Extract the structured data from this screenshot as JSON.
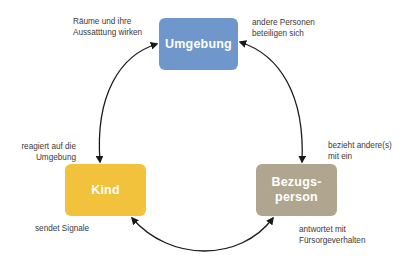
{
  "nodes": {
    "umgebung": {
      "label": "Umgebung",
      "color": "#6f97cc"
    },
    "kind": {
      "label": "Kind",
      "color": "#f2c23c"
    },
    "bezugsperson": {
      "label_line1": "Bezugs-",
      "label_line2": "person",
      "color": "#b0a690"
    }
  },
  "labels": {
    "top_left": {
      "line1": "Räume und ihre",
      "line2": "Aussatttung wirken"
    },
    "top_right": {
      "line1": "andere Personen",
      "line2": "beteiligen sich"
    },
    "left": {
      "line1": "reagiert auf die",
      "line2": "Umgebung"
    },
    "right": {
      "line1": "bezieht andere(s)",
      "line2": "mit ein"
    },
    "bottom_left": {
      "line1": "sendet Signale"
    },
    "bottom_right": {
      "line1": "antwortet mit",
      "line2": "Fürsorgeverhalten"
    }
  },
  "arrow_color": "#1a1a1a"
}
